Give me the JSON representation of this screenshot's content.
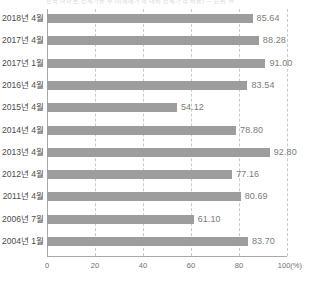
{
  "header": {
    "clipped_caption": "전국 아파트 전세가율 추이(매매가격 대비 전세가격 비율) — 단위 %"
  },
  "chart_data": {
    "type": "bar",
    "orientation": "horizontal",
    "title": "",
    "subtitle": "",
    "xlabel": "100(%)",
    "ylabel": "",
    "xlim": [
      0,
      100
    ],
    "xticks": [
      "0",
      "20",
      "40",
      "60",
      "80",
      "100(%)"
    ],
    "xtick_values": [
      0,
      20,
      40,
      60,
      80,
      100
    ],
    "grid": "vertical-dashed",
    "legend": "none",
    "bar_color": "#9d9d9d",
    "categories": [
      "2018년 4월",
      "2017년 4월",
      "2017년 1월",
      "2016년 4월",
      "2015년 4월",
      "2014년 4월",
      "2013년 4월",
      "2012년 4월",
      "2011년 4월",
      "2006년 7월",
      "2004년 1월"
    ],
    "values": [
      85.64,
      88.28,
      91.0,
      83.54,
      54.12,
      78.8,
      92.8,
      77.16,
      80.69,
      61.1,
      83.7
    ],
    "value_labels": [
      "85.64",
      "88.28",
      "91.00",
      "83.54",
      "54.12",
      "78.80",
      "92.80",
      "77.16",
      "80.69",
      "61.10",
      "83.70"
    ]
  }
}
